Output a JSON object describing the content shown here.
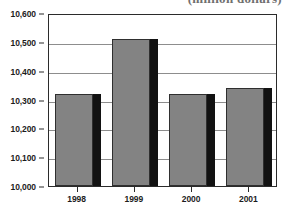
{
  "chart_data": {
    "type": "bar",
    "title": "(million dollars)",
    "xlabel": "",
    "ylabel": "",
    "categories": [
      "1998",
      "1999",
      "2000",
      "2001"
    ],
    "values": [
      10320,
      10510,
      10320,
      10340
    ],
    "series": [
      {
        "name": "",
        "values": [
          10320,
          10510,
          10320,
          10340
        ]
      }
    ],
    "ylim": [
      10000,
      10600
    ],
    "ytick_labels": [
      "10,000",
      "10,100",
      "10,200",
      "10,300",
      "10,400",
      "10,500",
      "10,600"
    ],
    "ytick_values": [
      10000,
      10100,
      10200,
      10300,
      10400,
      10500,
      10600
    ],
    "grid": true,
    "legend": false,
    "legend_position": "none",
    "bar_color": "#838383",
    "bar_shadow_color": "#121212",
    "bar_outline_color": "#2f2f2f",
    "gridline_color": "#8d8d8d",
    "axis_color": "#2b2b2b",
    "background_color": "#ffffff"
  }
}
